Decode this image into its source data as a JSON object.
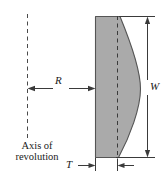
{
  "figure": {
    "kind": "engineering-dimension-diagram",
    "colors": {
      "solid_fill": "#aaaaaa",
      "solid_stroke": "#555555",
      "dimension_line": "#3a3a3a",
      "dashed_line": "#4a4a4a",
      "background": "#ffffff",
      "text": "#1a1a1a"
    },
    "labels": {
      "radius": "R",
      "width": "W",
      "thickness": "T",
      "axis_line1": "Axis of",
      "axis_line2": "revolution",
      "axis_full": "Axis of revolution"
    },
    "dimensions": {
      "radius_symbol": "R",
      "width_symbol": "W",
      "thickness_symbol": "T"
    },
    "geometry": {
      "axis_x": 27,
      "solid_left_x": 95,
      "inner_dashed_x": 117,
      "solid_top_y": 16,
      "solid_bottom_y": 158,
      "curve_max_x": 140,
      "width_dim_x": 147,
      "radius_dim_y": 88,
      "thickness_dim_y": 165
    }
  }
}
